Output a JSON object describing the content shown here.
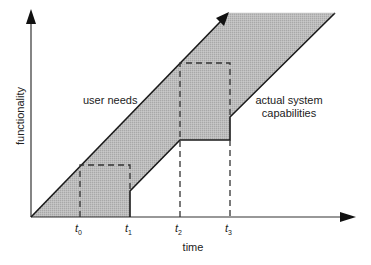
{
  "diagram": {
    "title": "",
    "axes": {
      "x_label": "time",
      "y_label": "functionality"
    },
    "ticks": [
      {
        "base": "t",
        "sub": "0"
      },
      {
        "base": "t",
        "sub": "1"
      },
      {
        "base": "t",
        "sub": "2"
      },
      {
        "base": "t",
        "sub": "3"
      }
    ],
    "annotations": {
      "user_needs": "user needs",
      "actual_system_line1": "actual system",
      "actual_system_line2": "capabilities"
    },
    "colors": {
      "fill": "#b7b7b7",
      "line": "#1a1a1a",
      "axis": "#333333",
      "text": "#222222"
    }
  }
}
